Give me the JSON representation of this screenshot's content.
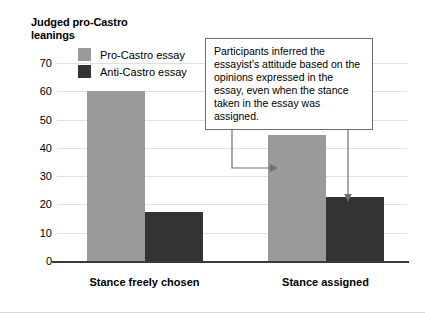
{
  "chart_data": {
    "type": "bar",
    "title": "",
    "ylabel": "Judged pro-Castro leanings",
    "xlabel": "",
    "categories": [
      "Stance freely chosen",
      "Stance assigned"
    ],
    "series": [
      {
        "name": "Pro-Castro essay",
        "color": "#9a9a9a",
        "values": [
          60,
          44.5
        ]
      },
      {
        "name": "Anti-Castro essay",
        "color": "#333333",
        "values": [
          17.5,
          22.5
        ]
      }
    ],
    "ylim": [
      0,
      70
    ],
    "yticks": [
      0,
      10,
      20,
      30,
      40,
      50,
      60,
      70
    ],
    "ytick_labels": [
      "0",
      "10",
      "20",
      "30",
      "40",
      "50",
      "60",
      "70"
    ],
    "grid": true,
    "legend_position": "top-left",
    "annotations": [
      {
        "text": "Participants inferred the essayist's attitude based on the opinions expressed in the essay, even when the stance taken in the essay was assigned.",
        "points_to": [
          "Stance assigned / Pro-Castro essay",
          "Stance assigned / Anti-Castro essay"
        ]
      }
    ]
  },
  "axis": {
    "y_title_line1": "Judged pro-Castro",
    "y_title_line2": "leanings"
  },
  "legend": {
    "items": [
      {
        "label": "Pro-Castro essay",
        "swatch": "pro"
      },
      {
        "label": "Anti-Castro essay",
        "swatch": "anti"
      }
    ]
  },
  "callout": {
    "text": "Participants inferred the essayist's attitude based on the opinions expressed in the essay, even when the stance taken in the essay was assigned."
  }
}
